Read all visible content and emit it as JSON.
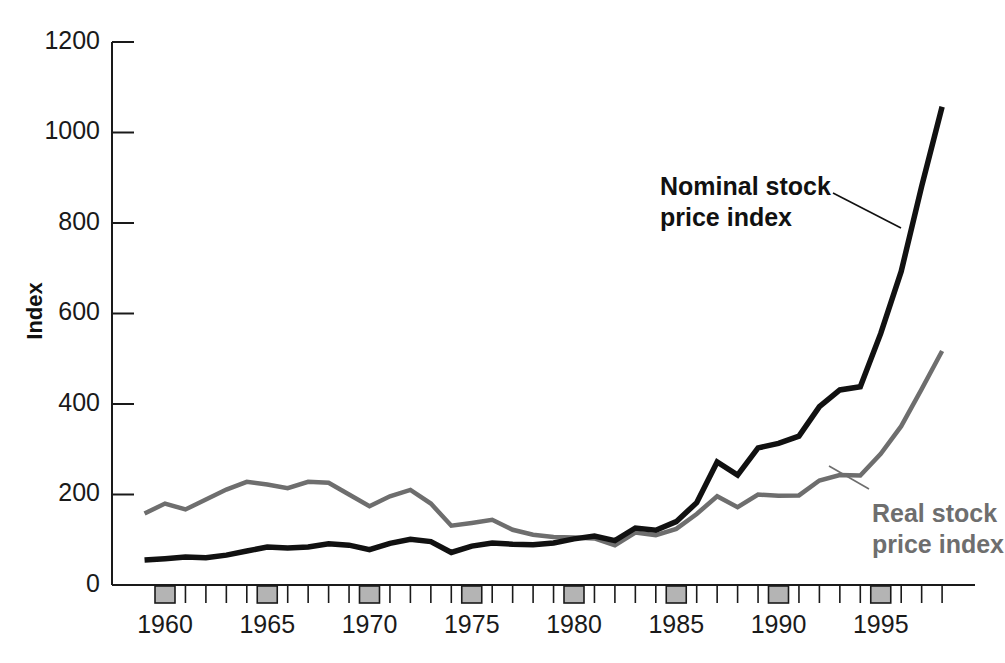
{
  "chart_data": {
    "type": "line",
    "title": "",
    "xlabel": "",
    "ylabel": "Index",
    "xlim": [
      1959,
      1998.5
    ],
    "ylim": [
      0,
      1200
    ],
    "yticks": [
      0,
      200,
      400,
      600,
      800,
      1000,
      1200
    ],
    "xticks_labeled": [
      1960,
      1965,
      1970,
      1975,
      1980,
      1985,
      1990,
      1995
    ],
    "xtick_minor_step": 1,
    "grid": false,
    "legend": "annotations-on-plot",
    "x": [
      1959,
      1960,
      1961,
      1962,
      1963,
      1964,
      1965,
      1966,
      1967,
      1968,
      1969,
      1970,
      1971,
      1972,
      1973,
      1974,
      1975,
      1976,
      1977,
      1978,
      1979,
      1980,
      1981,
      1982,
      1983,
      1984,
      1985,
      1986,
      1987,
      1988,
      1989,
      1990,
      1991,
      1992,
      1993,
      1994,
      1995,
      1996,
      1997,
      1998
    ],
    "series": [
      {
        "name": "Nominal stock price index",
        "color": "#111111",
        "values": [
          55,
          58,
          62,
          60,
          66,
          75,
          84,
          82,
          84,
          91,
          88,
          78,
          92,
          101,
          96,
          72,
          86,
          93,
          90,
          89,
          93,
          102,
          108,
          98,
          126,
          121,
          140,
          182,
          272,
          243,
          303,
          313,
          329,
          394,
          431,
          438,
          556,
          693,
          881,
          1057
        ]
      },
      {
        "name": "Real stock price index",
        "color": "#6e6e6e",
        "values": [
          158,
          180,
          167,
          189,
          211,
          228,
          222,
          214,
          228,
          226,
          200,
          174,
          196,
          210,
          180,
          131,
          137,
          144,
          122,
          111,
          106,
          105,
          103,
          88,
          116,
          110,
          124,
          157,
          196,
          172,
          200,
          197,
          198,
          231,
          243,
          242,
          290,
          351,
          433,
          517
        ]
      }
    ],
    "annotations": [
      {
        "text_lines": [
          "Nominal stock",
          "price index"
        ],
        "color": "#111111",
        "target_series": "Nominal stock price index"
      },
      {
        "text_lines": [
          "Real stock",
          "price index"
        ],
        "color": "#6e6e6e",
        "target_series": "Real stock price index"
      }
    ]
  },
  "axes": {
    "y_title": "Index",
    "y_tick_labels": [
      "1200",
      "1000",
      "800",
      "600",
      "400",
      "200",
      "0"
    ],
    "x_tick_labels": [
      "1960",
      "1965",
      "1970",
      "1975",
      "1980",
      "1985",
      "1990",
      "1995"
    ]
  },
  "annotations": {
    "nominal": {
      "line1": "Nominal stock",
      "line2": "price index"
    },
    "real": {
      "line1": "Real stock",
      "line2": "price index"
    }
  },
  "colors": {
    "nominal_line": "#111111",
    "real_line": "#6e6e6e",
    "axis": "#1a1a1a",
    "tick_block_fill": "#b4b4b4",
    "background": "#ffffff"
  }
}
